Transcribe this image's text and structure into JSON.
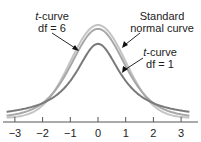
{
  "chart_data": {
    "type": "line",
    "title": "",
    "xlabel": "",
    "ylabel": "",
    "xlim": [
      -3.3,
      3.3
    ],
    "x_ticks": [
      -3,
      -2,
      -1,
      0,
      1,
      2,
      3
    ],
    "x_tick_labels": [
      "−3",
      "−2",
      "−1",
      "0",
      "1",
      "2",
      "3"
    ],
    "grid": false,
    "legend": "annotations with arrows",
    "series": [
      {
        "name": "Standard normal curve",
        "distribution": "normal",
        "df": null,
        "peak_density": 0.399,
        "color": "#c4c4c4"
      },
      {
        "name": "t-curve df = 6",
        "distribution": "t",
        "df": 6,
        "peak_density": 0.383,
        "color": "#a8a8a8"
      },
      {
        "name": "t-curve df = 1",
        "distribution": "t",
        "df": 1,
        "peak_density": 0.318,
        "color": "#7a7a7a"
      }
    ],
    "annotations": [
      {
        "text_italic": "t",
        "text": "-curve",
        "line2": "df = 6",
        "points_to": "t-curve df = 6",
        "arrow_target_x": -0.75
      },
      {
        "text": "Standard",
        "line2": "normal curve",
        "points_to": "Standard normal curve",
        "arrow_target_x": 0.85
      },
      {
        "text_italic": "t",
        "text": "-curve",
        "line2": "df = 1",
        "points_to": "t-curve df = 1",
        "arrow_target_x": 0.85
      }
    ]
  },
  "labels": {
    "t6_italic": "t",
    "t6_line1": "-curve",
    "t6_line2": "df = 6",
    "normal_line1": "Standard",
    "normal_line2": "normal curve",
    "t1_italic": "t",
    "t1_line1": "-curve",
    "t1_line2": "df = 1"
  }
}
